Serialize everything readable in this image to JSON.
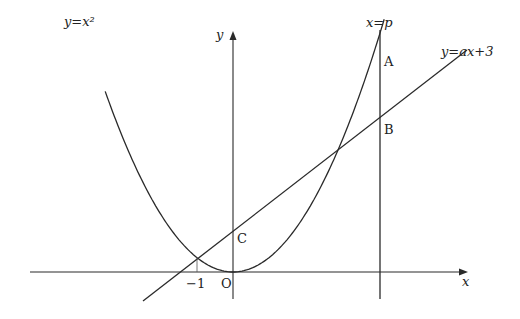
{
  "diagram": {
    "labels": {
      "parabola": "y=x²",
      "vertical_line": "x=p",
      "line": "y=ax+3",
      "y_axis": "y",
      "x_axis": "x",
      "point_A": "A",
      "point_B": "B",
      "point_C": "C",
      "origin": "O",
      "tick_minus_one": "−1"
    },
    "math": {
      "parabola": "y = x^2",
      "line": "y = ax + 3",
      "line_slope_a": 2,
      "vertical_line_p": 4,
      "intersections_parabola_line": [
        [
          -1,
          1
        ],
        [
          3,
          9
        ]
      ],
      "point_C": [
        0,
        3
      ],
      "point_A": [
        4,
        16
      ],
      "point_B": [
        4,
        11
      ]
    },
    "colors": {
      "stroke": "#2a2a2a",
      "background": "#ffffff"
    }
  }
}
